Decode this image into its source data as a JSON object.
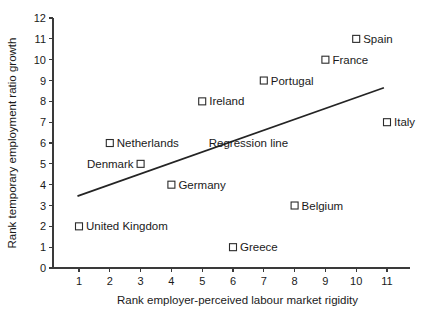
{
  "chart_data": {
    "type": "scatter",
    "title": "",
    "xlabel": "Rank employer-perceived labour market rigidity",
    "ylabel": "Rank temporary employment ratio growth",
    "xlim": [
      0.3,
      11.8
    ],
    "ylim": [
      0,
      12
    ],
    "xticks": [
      1,
      2,
      3,
      4,
      5,
      6,
      7,
      8,
      9,
      10,
      11
    ],
    "xticklabels": [
      "1",
      "2",
      "3",
      "4",
      "5",
      "6",
      "7",
      "8",
      "9",
      "10",
      "11"
    ],
    "yticks": [
      0,
      1,
      2,
      3,
      4,
      5,
      6,
      7,
      8,
      9,
      10,
      11,
      12
    ],
    "yticklabels": [
      "0",
      "1",
      "2",
      "3",
      "4",
      "5",
      "6",
      "7",
      "8",
      "9",
      "10",
      "11",
      "12"
    ],
    "grid": false,
    "legend": "none",
    "marker": "open-square",
    "points": [
      {
        "label": "Spain",
        "x": 10,
        "y": 11,
        "label_side": "right"
      },
      {
        "label": "France",
        "x": 9,
        "y": 10,
        "label_side": "right"
      },
      {
        "label": "Portugal",
        "x": 7,
        "y": 9,
        "label_side": "right"
      },
      {
        "label": "Ireland",
        "x": 5,
        "y": 8,
        "label_side": "right"
      },
      {
        "label": "Italy",
        "x": 11,
        "y": 7,
        "label_side": "right"
      },
      {
        "label": "Netherlands",
        "x": 2,
        "y": 6,
        "label_side": "right"
      },
      {
        "label": "Denmark",
        "x": 3,
        "y": 5,
        "label_side": "left"
      },
      {
        "label": "Germany",
        "x": 4,
        "y": 4,
        "label_side": "right"
      },
      {
        "label": "Belgium",
        "x": 8,
        "y": 3,
        "label_side": "right"
      },
      {
        "label": "United Kingdom",
        "x": 1,
        "y": 2,
        "label_side": "right"
      },
      {
        "label": "Greece",
        "x": 6,
        "y": 1,
        "label_side": "right"
      }
    ],
    "regression_line": {
      "label": "Regression line",
      "x_start": 0.95,
      "y_start": 3.45,
      "x_end": 10.9,
      "y_end": 8.65,
      "label_x": 6.5,
      "label_y": 6.0
    },
    "colors": {
      "axis": "#3a3a3a",
      "marker_stroke": "#2b2b2b",
      "marker_fill": "#ffffff",
      "line": "#242424",
      "text": "#1a1a1a",
      "background": "#ffffff"
    }
  }
}
